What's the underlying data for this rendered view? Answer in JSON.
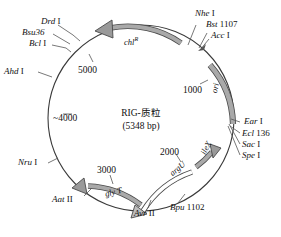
{
  "figure": {
    "type": "plasmid-map",
    "center": {
      "name": "RIG-质粒",
      "size": "(5348 bp)"
    },
    "circle": {
      "cx": 141,
      "cy": 118,
      "r": 93,
      "stroke": "#3a3a3a"
    },
    "scale_ticks": [
      {
        "label": "1000",
        "x": 183,
        "y": 86
      },
      {
        "label": "2000",
        "x": 160,
        "y": 148
      },
      {
        "label": "3000",
        "x": 97,
        "y": 166
      },
      {
        "label": "~4000",
        "x": 53,
        "y": 114
      },
      {
        "label": "5000",
        "x": 78,
        "y": 66
      }
    ],
    "restriction_sites": [
      {
        "name": "Drd",
        "numeral": "I",
        "x": 41,
        "y": 22,
        "align": "right"
      },
      {
        "name": "Bsu36",
        "numeral": "",
        "x": 22,
        "y": 32,
        "align": "right"
      },
      {
        "name": "Bcl",
        "numeral": "I",
        "x": 29,
        "y": 42,
        "align": "right"
      },
      {
        "name": "Ahd",
        "numeral": "I",
        "x": 7,
        "y": 72,
        "align": "left"
      },
      {
        "name": "Nru",
        "numeral": "I",
        "x": 21,
        "y": 163,
        "align": "left"
      },
      {
        "name": "Aat",
        "numeral": "II",
        "x": 54,
        "y": 200,
        "align": "left"
      },
      {
        "name": "Avr",
        "numeral": "II",
        "x": 137,
        "y": 213,
        "align": "left"
      },
      {
        "name": "Bpu",
        "numeral": "1102",
        "x": 172,
        "y": 208,
        "align": "left"
      },
      {
        "name": "Spe",
        "numeral": "I",
        "x": 243,
        "y": 156,
        "align": "left"
      },
      {
        "name": "Sac",
        "numeral": "I",
        "x": 243,
        "y": 145,
        "align": "left"
      },
      {
        "name": "Ecl",
        "numeral": "136",
        "x": 243,
        "y": 134,
        "align": "left"
      },
      {
        "name": "Ear",
        "numeral": "I",
        "x": 245,
        "y": 122,
        "align": "left"
      },
      {
        "name": "Acc",
        "numeral": "I",
        "x": 212,
        "y": 36,
        "align": "left"
      },
      {
        "name": "Bst",
        "numeral": "1107",
        "x": 206,
        "y": 25,
        "align": "left"
      },
      {
        "name": "Nhe",
        "numeral": "I",
        "x": 196,
        "y": 14,
        "align": "left"
      }
    ],
    "genes": [
      {
        "label": "chl",
        "sup": "R",
        "x": 120,
        "y": 38,
        "rot": "rot-glyt"
      },
      {
        "label": "ori",
        "sup": "",
        "x": 212,
        "y": 92,
        "rot": "rot-ori"
      },
      {
        "label": "ileX",
        "sup": "",
        "x": 200,
        "y": 151,
        "rot": "rot-ilex"
      },
      {
        "label": "argU",
        "sup": "",
        "x": 169,
        "y": 170,
        "rot": "rot-argu"
      },
      {
        "label": "gly T",
        "sup": "",
        "x": 104,
        "y": 189,
        "rot": "rot-glyt"
      }
    ],
    "colors": {
      "circle_line": "#3a3a3a",
      "arc_fill": "#a9a9a9",
      "arc_stroke": "#4a4a4a",
      "leader_line": "#555555",
      "text": "#111111"
    }
  }
}
